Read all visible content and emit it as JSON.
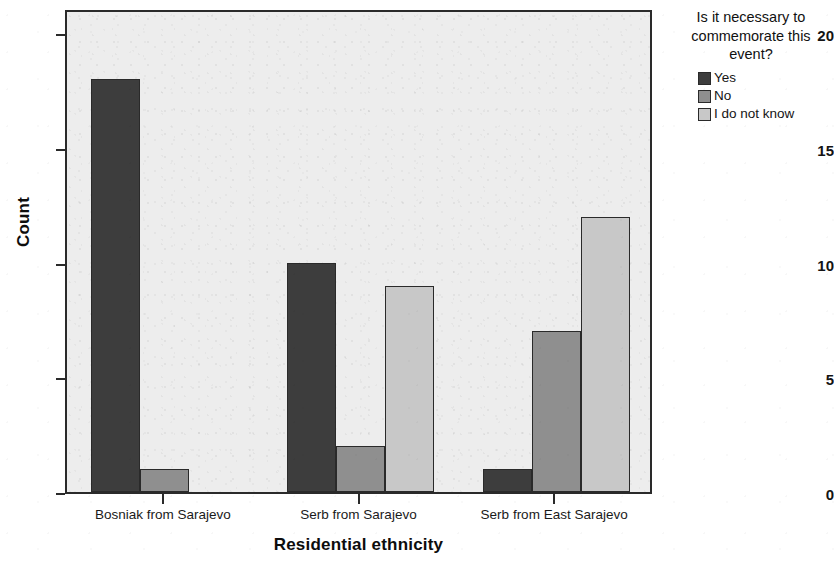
{
  "chart_data": {
    "type": "bar",
    "title": "",
    "xlabel": "Residential ethnicity",
    "ylabel": "Count",
    "categories": [
      "Bosniak from Sarajevo",
      "Serb from Sarajevo",
      "Serb from East Sarajevo"
    ],
    "series": [
      {
        "name": "Yes",
        "color": "#3d3d3d",
        "values": [
          18,
          10,
          1
        ]
      },
      {
        "name": "No",
        "color": "#8f8f8f",
        "values": [
          1,
          2,
          7
        ]
      },
      {
        "name": "I do not know",
        "color": "#c8c8c8",
        "values": [
          0,
          9,
          12
        ]
      }
    ],
    "ylim": [
      0,
      21.1
    ],
    "yticks": [
      0,
      5,
      10,
      15,
      20
    ],
    "ytick_labels": [
      "0",
      "5",
      "10",
      "15",
      "20"
    ],
    "grid": false,
    "legend_position": "right",
    "legend_title": "Is it necessary to commemorate this event?",
    "plot_background": "#ededed",
    "axis_color": "#2a2a2a"
  },
  "legend": {
    "title_line1": "Is it necessary to",
    "title_line2": "commemorate this",
    "title_line3": "event?"
  }
}
